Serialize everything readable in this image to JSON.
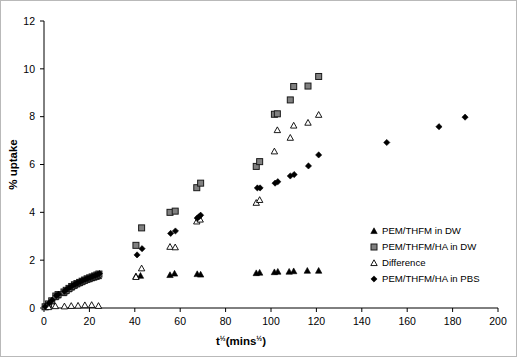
{
  "chart_data": {
    "type": "scatter",
    "title": "",
    "xlabel": "t½(mins½)",
    "ylabel": "% uptake",
    "xlim": [
      0,
      200
    ],
    "ylim": [
      0,
      12
    ],
    "xticks": [
      0,
      20,
      40,
      60,
      80,
      100,
      120,
      140,
      160,
      180,
      200
    ],
    "yticks": [
      0,
      2,
      4,
      6,
      8,
      10,
      12
    ],
    "grid": false,
    "legend_position": "right-inside",
    "series": [
      {
        "name": "PEM/THFM in DW",
        "marker": "filled-triangle",
        "color": "#000000",
        "points": [
          [
            0.5,
            0.05
          ],
          [
            2.0,
            0.15
          ],
          [
            3.4,
            0.28
          ],
          [
            5.0,
            0.45
          ],
          [
            6.0,
            0.52
          ],
          [
            8.6,
            0.62
          ],
          [
            9.5,
            0.7
          ],
          [
            10.9,
            0.78
          ],
          [
            12.0,
            0.85
          ],
          [
            13.2,
            0.92
          ],
          [
            14.3,
            0.98
          ],
          [
            15.5,
            1.03
          ],
          [
            16.6,
            1.08
          ],
          [
            17.7,
            1.13
          ],
          [
            18.8,
            1.17
          ],
          [
            19.9,
            1.2
          ],
          [
            21.0,
            1.24
          ],
          [
            22.0,
            1.27
          ],
          [
            23.0,
            1.3
          ],
          [
            24.0,
            1.33
          ],
          [
            40.5,
            1.33
          ],
          [
            42.5,
            1.35
          ],
          [
            55.5,
            1.38
          ],
          [
            57.5,
            1.44
          ],
          [
            67.5,
            1.42
          ],
          [
            69.0,
            1.4
          ],
          [
            93.5,
            1.46
          ],
          [
            95.0,
            1.48
          ],
          [
            101.5,
            1.5
          ],
          [
            103.0,
            1.52
          ],
          [
            108.0,
            1.52
          ],
          [
            110.0,
            1.54
          ],
          [
            116.0,
            1.56
          ],
          [
            121.0,
            1.56
          ]
        ]
      },
      {
        "name": "PEM/THFM/HA in DW",
        "marker": "gray-square",
        "color": "#7f7f7f",
        "points": [
          [
            0.5,
            0.05
          ],
          [
            2.0,
            0.17
          ],
          [
            3.4,
            0.3
          ],
          [
            5.2,
            0.5
          ],
          [
            6.2,
            0.56
          ],
          [
            8.8,
            0.67
          ],
          [
            9.8,
            0.74
          ],
          [
            11.0,
            0.82
          ],
          [
            12.2,
            0.9
          ],
          [
            13.4,
            0.97
          ],
          [
            14.5,
            1.02
          ],
          [
            15.7,
            1.07
          ],
          [
            16.8,
            1.12
          ],
          [
            17.9,
            1.17
          ],
          [
            19.0,
            1.22
          ],
          [
            20.1,
            1.26
          ],
          [
            21.2,
            1.3
          ],
          [
            22.3,
            1.34
          ],
          [
            23.3,
            1.38
          ],
          [
            24.2,
            1.42
          ],
          [
            40.5,
            2.62
          ],
          [
            43.0,
            3.35
          ],
          [
            55.5,
            4.0
          ],
          [
            57.8,
            4.05
          ],
          [
            67.3,
            5.03
          ],
          [
            69.0,
            5.22
          ],
          [
            93.5,
            5.92
          ],
          [
            95.0,
            6.12
          ],
          [
            101.5,
            8.1
          ],
          [
            102.8,
            8.12
          ],
          [
            108.5,
            8.7
          ],
          [
            110.0,
            9.26
          ],
          [
            116.3,
            9.28
          ],
          [
            121.0,
            9.68
          ]
        ]
      },
      {
        "name": "Difference",
        "marker": "open-triangle",
        "color": "#000000",
        "points": [
          [
            2.0,
            0.04
          ],
          [
            5.0,
            0.08
          ],
          [
            9.0,
            0.07
          ],
          [
            12.0,
            0.09
          ],
          [
            15.0,
            0.1
          ],
          [
            18.0,
            0.12
          ],
          [
            21.0,
            0.13
          ],
          [
            24.0,
            0.09
          ],
          [
            40.5,
            1.3
          ],
          [
            43.0,
            1.66
          ],
          [
            55.5,
            2.56
          ],
          [
            57.8,
            2.54
          ],
          [
            67.3,
            3.62
          ],
          [
            68.8,
            3.7
          ],
          [
            93.5,
            4.4
          ],
          [
            95.0,
            4.52
          ],
          [
            101.5,
            6.55
          ],
          [
            102.8,
            7.44
          ],
          [
            108.5,
            7.12
          ],
          [
            110.0,
            7.63
          ],
          [
            116.3,
            7.75
          ],
          [
            121.0,
            8.08
          ]
        ]
      },
      {
        "name": "PEM/THFM/HA in PBS",
        "marker": "filled-diamond",
        "color": "#000000",
        "points": [
          [
            0.5,
            0.06
          ],
          [
            2.2,
            0.2
          ],
          [
            3.6,
            0.33
          ],
          [
            5.4,
            0.52
          ],
          [
            6.4,
            0.58
          ],
          [
            9.0,
            0.7
          ],
          [
            10.1,
            0.78
          ],
          [
            11.3,
            0.86
          ],
          [
            12.5,
            0.93
          ],
          [
            13.7,
            1.0
          ],
          [
            14.8,
            1.05
          ],
          [
            16.0,
            1.1
          ],
          [
            17.1,
            1.15
          ],
          [
            18.2,
            1.2
          ],
          [
            19.3,
            1.24
          ],
          [
            20.4,
            1.28
          ],
          [
            21.5,
            1.32
          ],
          [
            22.6,
            1.36
          ],
          [
            23.6,
            1.4
          ],
          [
            24.4,
            1.44
          ],
          [
            41.0,
            2.22
          ],
          [
            43.2,
            2.48
          ],
          [
            55.8,
            3.12
          ],
          [
            57.9,
            3.22
          ],
          [
            67.5,
            3.76
          ],
          [
            68.3,
            3.82
          ],
          [
            69.0,
            3.88
          ],
          [
            94.0,
            5.02
          ],
          [
            95.2,
            5.02
          ],
          [
            101.8,
            5.22
          ],
          [
            103.0,
            5.28
          ],
          [
            108.5,
            5.52
          ],
          [
            110.2,
            5.58
          ],
          [
            116.5,
            5.94
          ],
          [
            121.0,
            6.4
          ],
          [
            151.0,
            6.92
          ],
          [
            174.0,
            7.58
          ],
          [
            185.5,
            7.98
          ]
        ]
      }
    ],
    "legend": [
      {
        "label": "PEM/THFM in DW",
        "marker": "filled-triangle"
      },
      {
        "label": "PEM/THFM/HA in DW",
        "marker": "gray-square"
      },
      {
        "label": "Difference",
        "marker": "open-triangle"
      },
      {
        "label": "PEM/THFM/HA in PBS",
        "marker": "filled-diamond"
      }
    ]
  }
}
